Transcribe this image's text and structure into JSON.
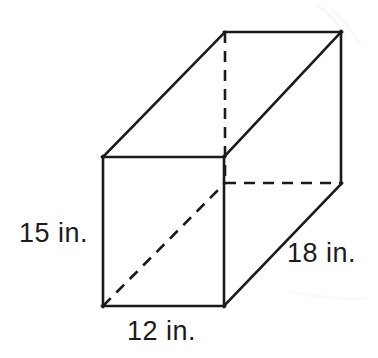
{
  "figure": {
    "name": "rectangular-prism",
    "background_color": "#ffffff",
    "line_color": "#1a1a1a",
    "text_color": "#1c1c1c",
    "unit": "in.",
    "labels": {
      "height": "15 in.",
      "width": "12 in.",
      "depth": "18 in."
    },
    "dimensions": {
      "height_value": 15,
      "width_value": 12,
      "depth_value": 18
    },
    "geometry": {
      "front_face": {
        "top_left": [
          103,
          157
        ],
        "top_right": [
          224,
          157
        ],
        "bottom_right": [
          224,
          306
        ],
        "bottom_left": [
          103,
          306
        ]
      },
      "back_face": {
        "top_left": [
          225,
          32
        ],
        "top_right": [
          341,
          32
        ],
        "bottom_right": [
          341,
          183
        ],
        "bottom_left": [
          225,
          183
        ]
      },
      "solid_edges": [
        [
          [
            103,
            157
          ],
          [
            224,
            157
          ]
        ],
        [
          [
            224,
            157
          ],
          [
            224,
            306
          ]
        ],
        [
          [
            224,
            306
          ],
          [
            103,
            306
          ]
        ],
        [
          [
            103,
            306
          ],
          [
            103,
            157
          ]
        ],
        [
          [
            103,
            157
          ],
          [
            225,
            32
          ]
        ],
        [
          [
            225,
            32
          ],
          [
            341,
            32
          ]
        ],
        [
          [
            341,
            32
          ],
          [
            341,
            183
          ]
        ],
        [
          [
            224,
            157
          ],
          [
            341,
            32
          ]
        ],
        [
          [
            224,
            306
          ],
          [
            341,
            183
          ]
        ]
      ],
      "dashed_edges": [
        [
          [
            225,
            32
          ],
          [
            225,
            183
          ]
        ],
        [
          [
            225,
            183
          ],
          [
            341,
            183
          ]
        ],
        [
          [
            103,
            306
          ],
          [
            225,
            183
          ]
        ]
      ]
    }
  }
}
